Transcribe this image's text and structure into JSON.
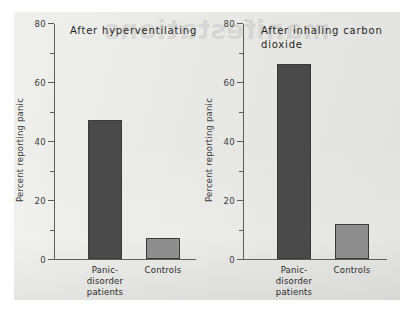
{
  "figure": {
    "bleed_through_text": "manifestations",
    "panel_background": "#e9e9e7"
  },
  "chart_data": {
    "type": "bar",
    "xlabel": "",
    "ylabel": "Percent reporting panic",
    "ylim": [
      0,
      80
    ],
    "yticks": [
      0,
      20,
      40,
      60,
      80
    ],
    "ytick_labels": [
      "0",
      "20",
      "40",
      "60",
      "80"
    ],
    "yminor_ticks": [
      10,
      30,
      50,
      70
    ],
    "grid": false,
    "legend": "none",
    "categories": [
      "Panic-disorder patients",
      "Controls"
    ],
    "panels": [
      {
        "title": "After hyperventilating",
        "categories": [
          "Panic-\ndisorder\npatients",
          "Controls"
        ],
        "values": [
          47,
          7
        ],
        "colors": [
          "#4a4a4a",
          "#8e8e8e"
        ]
      },
      {
        "title": "After inhaling carbon\ndioxide",
        "categories": [
          "Panic-\ndisorder\npatients",
          "Controls"
        ],
        "values": [
          66,
          12
        ],
        "colors": [
          "#4a4a4a",
          "#8e8e8e"
        ]
      }
    ]
  }
}
